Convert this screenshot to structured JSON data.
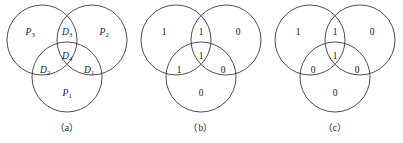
{
  "figure": {
    "background_color": "#ffffff",
    "stroke_color": "#3a3a3a",
    "text_color": "#141414",
    "geometry": {
      "circle_radius": 35,
      "top_left_center": [
        42,
        40
      ],
      "top_right_center": [
        92,
        40
      ],
      "bottom_center": [
        67,
        77
      ]
    },
    "panels": [
      {
        "caption": "（a）",
        "label_style": "italic",
        "cells": [
          {
            "name": "top-left-only",
            "text": "P",
            "sub": "3",
            "x": 30,
            "y": 33
          },
          {
            "name": "top-lens",
            "text": "D",
            "sub": "3",
            "x": 67,
            "y": 33
          },
          {
            "name": "top-right-only",
            "text": "P",
            "sub": "2",
            "x": 104,
            "y": 33
          },
          {
            "name": "center",
            "text": "D",
            "sub": "4",
            "x": 67,
            "y": 57
          },
          {
            "name": "left-lens",
            "text": "D",
            "sub": "2",
            "x": 45,
            "y": 71
          },
          {
            "name": "right-lens",
            "text": "D",
            "sub": "1",
            "x": 89,
            "y": 71
          },
          {
            "name": "bottom-only",
            "text": "P",
            "sub": "1",
            "x": 67,
            "y": 94
          }
        ]
      },
      {
        "caption": "（b）",
        "label_style": "upright",
        "cells": [
          {
            "name": "top-left-only",
            "text": "1",
            "sub": "",
            "x": 30,
            "y": 33
          },
          {
            "name": "top-lens",
            "text": "1",
            "sub": "",
            "x": 67,
            "y": 33
          },
          {
            "name": "top-right-only",
            "text": "0",
            "sub": "",
            "x": 104,
            "y": 33
          },
          {
            "name": "center",
            "text": "1",
            "sub": "",
            "x": 67,
            "y": 57
          },
          {
            "name": "left-lens",
            "text": "1",
            "sub": "",
            "x": 45,
            "y": 71
          },
          {
            "name": "right-lens",
            "text": "0",
            "sub": "",
            "x": 89,
            "y": 71
          },
          {
            "name": "bottom-only",
            "text": "0",
            "sub": "",
            "x": 67,
            "y": 94
          }
        ]
      },
      {
        "caption": "（c）",
        "label_style": "upright",
        "cells": [
          {
            "name": "top-left-only",
            "text": "1",
            "sub": "",
            "x": 30,
            "y": 33
          },
          {
            "name": "top-lens",
            "text": "1",
            "sub": "",
            "x": 67,
            "y": 33
          },
          {
            "name": "top-right-only",
            "text": "0",
            "sub": "",
            "x": 104,
            "y": 33
          },
          {
            "name": "center",
            "text": "1",
            "sub": "",
            "x": 67,
            "y": 57
          },
          {
            "name": "left-lens",
            "text": "0",
            "sub": "",
            "x": 45,
            "y": 71
          },
          {
            "name": "right-lens",
            "text": "0",
            "sub": "",
            "x": 89,
            "y": 71
          },
          {
            "name": "bottom-only",
            "text": "0",
            "sub": "",
            "x": 67,
            "y": 94
          }
        ]
      }
    ]
  }
}
